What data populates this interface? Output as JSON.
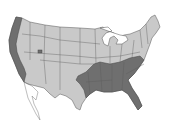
{
  "map": {
    "subject": "United States",
    "regions": [
      {
        "name": "Pacific coast",
        "shade": "dark"
      },
      {
        "name": "Southeast",
        "shade": "dark"
      },
      {
        "name": "Utah spot",
        "shade": "dark"
      },
      {
        "name": "Rest of country",
        "shade": "light"
      }
    ],
    "colors": {
      "background": "#ffffff",
      "light_fill": "#c9c9c9",
      "dark_fill": "#6f6f6f",
      "outline": "#555555"
    }
  }
}
